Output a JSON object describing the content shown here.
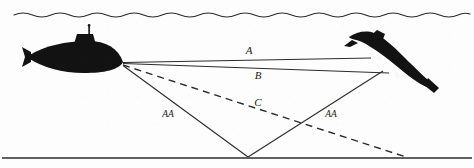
{
  "figure": {
    "kind": "technical-illustration",
    "background_color": "#fdfdfd",
    "ink_color": "#1a1a1a"
  },
  "surface": {
    "name": "sea-surface-wave-line",
    "y": 14,
    "amplitude": 3,
    "wavelength": 37,
    "x_start": 14,
    "x_end": 466
  },
  "seabed": {
    "name": "seabed-line",
    "y": 158,
    "x_start": 2,
    "x_end": 472
  },
  "submarines": [
    {
      "id": "own-ship",
      "label": "",
      "position": "left",
      "bow_point": {
        "x": 123,
        "y": 63
      },
      "has_conning_tower": true,
      "has_mast": true
    },
    {
      "id": "target",
      "label": "",
      "position": "right",
      "tilted": true,
      "markers": [
        {
          "name": "point-a",
          "text": "a",
          "x": 379,
          "y": 58
        },
        {
          "name": "point-b",
          "text": "b",
          "x": 396,
          "y": 76
        }
      ]
    }
  ],
  "paths": [
    {
      "name": "path-A",
      "label": "A",
      "style": "solid",
      "label_x": 249,
      "label_y": 54,
      "from": {
        "x": 123,
        "y": 63
      },
      "to": {
        "x": 371,
        "y": 58
      }
    },
    {
      "name": "path-B",
      "label": "B",
      "style": "solid",
      "label_x": 258,
      "label_y": 79,
      "from": {
        "x": 123,
        "y": 63
      },
      "to": {
        "x": 389,
        "y": 73
      }
    },
    {
      "name": "path-C",
      "label": "C",
      "style": "dashed",
      "label_x": 258,
      "label_y": 106,
      "from": {
        "x": 123,
        "y": 65
      },
      "to": {
        "x": 406,
        "y": 157
      }
    },
    {
      "name": "path-AA-outbound",
      "label": "AA",
      "style": "solid",
      "label_x": 168,
      "label_y": 116,
      "from": {
        "x": 123,
        "y": 65
      },
      "to": {
        "x": 248,
        "y": 157
      }
    },
    {
      "name": "path-AA-return",
      "label": "AA",
      "style": "solid",
      "label_x": 330,
      "label_y": 116,
      "from": {
        "x": 248,
        "y": 157
      },
      "to": {
        "x": 383,
        "y": 71
      }
    }
  ],
  "reflection_point": {
    "name": "seabed-bounce-point",
    "x": 248,
    "y": 157
  }
}
